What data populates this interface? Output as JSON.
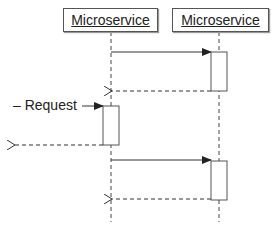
{
  "participants": [
    {
      "name": "Microservice"
    },
    {
      "name": "Microservice"
    }
  ],
  "messages": [
    {
      "from": "participant_1",
      "to": "participant_2",
      "style": "solid",
      "label": ""
    },
    {
      "from": "participant_2",
      "to": "participant_1",
      "style": "dashed",
      "label": ""
    },
    {
      "from": "external",
      "to": "participant_1",
      "style": "solid",
      "label": "Request",
      "prefix": "–"
    },
    {
      "from": "participant_1",
      "to": "external",
      "style": "dashed",
      "label": ""
    },
    {
      "from": "participant_1",
      "to": "participant_2",
      "style": "solid",
      "label": ""
    },
    {
      "from": "participant_2",
      "to": "participant_1",
      "style": "dashed",
      "label": ""
    }
  ],
  "request_label": "– Request",
  "colors": {
    "line": "#333333",
    "box_border": "#555555",
    "background": "#ffffff"
  }
}
